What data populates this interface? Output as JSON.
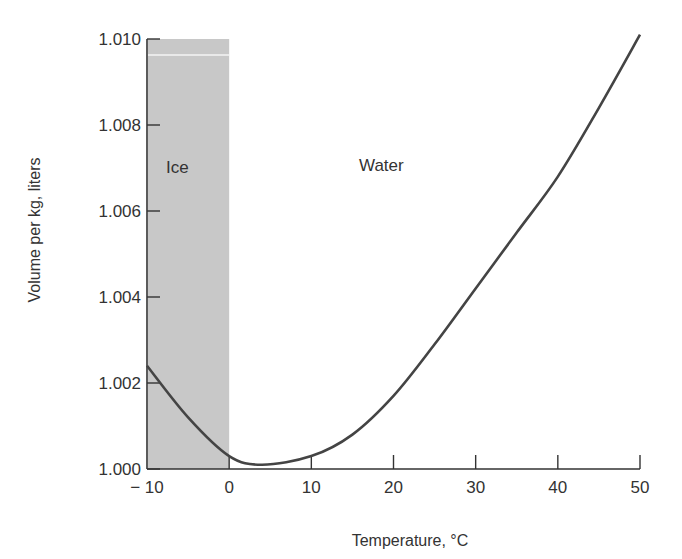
{
  "chart_data": {
    "type": "line",
    "title": "",
    "xlabel": "Temperature, °C",
    "ylabel": "Volume per kg, liters",
    "xlim": [
      -10,
      50
    ],
    "ylim": [
      1.0,
      1.01
    ],
    "x_ticks": [
      -10,
      0,
      10,
      20,
      30,
      40,
      50
    ],
    "x_tick_labels": [
      "− 10",
      "0",
      "10",
      "20",
      "30",
      "40",
      "50"
    ],
    "y_ticks": [
      1.0,
      1.002,
      1.004,
      1.006,
      1.008,
      1.01
    ],
    "y_tick_labels": [
      "1.000",
      "1.002",
      "1.004",
      "1.006",
      "1.008",
      "1.010"
    ],
    "grid": false,
    "legend": null,
    "series": [
      {
        "name": "Volume per kg",
        "x": [
          -10,
          -5,
          0,
          4,
          10,
          15,
          20,
          25,
          30,
          35,
          40,
          45,
          50
        ],
        "values": [
          1.0024,
          1.0012,
          1.0003,
          1.0001,
          1.0003,
          1.0008,
          1.0017,
          1.0029,
          1.0042,
          1.0055,
          1.0068,
          1.0084,
          1.0101
        ],
        "color": "#444444"
      }
    ],
    "annotations": [
      {
        "text": "Ice",
        "region": "shaded",
        "x_range": [
          -10,
          0
        ],
        "color": "#c8c8c8"
      },
      {
        "text": "Water",
        "x": 14,
        "y": 1.0071
      }
    ]
  },
  "labels": {
    "ice": "Ice",
    "water": "Water",
    "xlabel": "Temperature, °C",
    "ylabel": "Volume per kg, liters"
  },
  "colors": {
    "shade": "#c8c8c8",
    "curve": "#444444",
    "axis": "#333333"
  }
}
